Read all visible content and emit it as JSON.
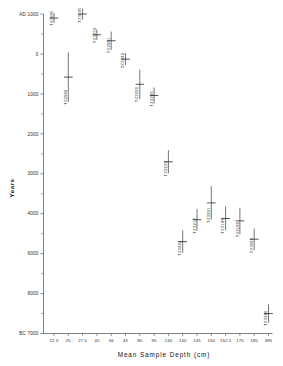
{
  "chart_data": {
    "type": "scatter",
    "title": "",
    "xlabel": "Mean Sample Depth (cm)",
    "ylabel": "Years",
    "y_top_label": "AD 1000",
    "y_bottom_label": "BC 7000",
    "grid": false,
    "legend": "none",
    "y_inverted": true,
    "ylim": [
      -1000,
      7000
    ],
    "ytick_labels": [
      "AD 1000",
      "0",
      "1000",
      "2000",
      "3000",
      "4000",
      "6000",
      "8000",
      "BC 7000"
    ],
    "ytick_values": [
      -1000,
      0,
      1000,
      2000,
      3000,
      4000,
      5000,
      6000,
      7000
    ],
    "ytick_display": [
      "AD 1000",
      "0",
      "1000",
      "2000",
      "3000",
      "4000",
      "6000",
      "8000",
      "BC 7000"
    ],
    "xtick_labels": [
      "22.5",
      "25",
      "27.5",
      "40",
      "46",
      "45",
      "80",
      "95",
      "130",
      "140",
      "145",
      "150",
      "152.5",
      "175",
      "180",
      "385"
    ],
    "points": [
      {
        "label": "TX3085",
        "x_tick_index": 0,
        "y": -900,
        "err": 120
      },
      {
        "label": "TX2984",
        "x_tick_index": 1,
        "y": 580,
        "err": 620
      },
      {
        "label": "TX3045",
        "x_tick_index": 2,
        "y": -1000,
        "err": 140
      },
      {
        "label": "TX3059",
        "x_tick_index": 3,
        "y": -480,
        "err": 130
      },
      {
        "label": "TX2981",
        "x_tick_index": 4,
        "y": -330,
        "err": 230
      },
      {
        "label": "TX3242",
        "x_tick_index": 5,
        "y": 130,
        "err": 150
      },
      {
        "label": "TX3220",
        "x_tick_index": 6,
        "y": 760,
        "err": 370
      },
      {
        "label": "TX3246",
        "x_tick_index": 7,
        "y": 1040,
        "err": 200
      },
      {
        "label": "TX3232",
        "x_tick_index": 8,
        "y": 2700,
        "err": 290
      },
      {
        "label": "TX3224",
        "x_tick_index": 9,
        "y": 4700,
        "err": 280
      },
      {
        "label": "TX3219",
        "x_tick_index": 10,
        "y": 4150,
        "err": 270
      },
      {
        "label": "TX3201",
        "x_tick_index": 11,
        "y": 3730,
        "err": 420
      },
      {
        "label": "TX3188",
        "x_tick_index": 12,
        "y": 4120,
        "err": 300
      },
      {
        "label": "TX3180",
        "x_tick_index": 13,
        "y": 4180,
        "err": 330
      },
      {
        "label": "TX3089",
        "x_tick_index": 14,
        "y": 4640,
        "err": 270
      },
      {
        "label": "TX3286",
        "x_tick_index": 15,
        "y": 6500,
        "err": 230
      }
    ]
  }
}
